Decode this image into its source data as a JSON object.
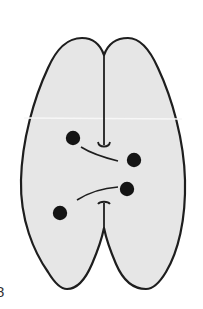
{
  "figure": {
    "panel_label": "8",
    "colors": {
      "fill": "#e6e6e6",
      "stroke": "#1e1e1e",
      "dot": "#141414",
      "background": "#ffffff",
      "scan_line": "#f7f7f7"
    },
    "outline": {
      "top_notch": [
        104,
        55
      ],
      "bottom_notch": [
        104,
        228
      ],
      "left_extent_x": 21,
      "right_extent_x": 185,
      "top_y": 38,
      "bottom_y": 289
    },
    "dots": [
      {
        "id": "dot-1",
        "cx": 73,
        "cy": 138,
        "r": 7
      },
      {
        "id": "dot-2",
        "cx": 134,
        "cy": 160,
        "r": 7
      },
      {
        "id": "dot-3",
        "cx": 127,
        "cy": 189,
        "r": 7
      },
      {
        "id": "dot-4",
        "cx": 60,
        "cy": 213,
        "r": 7
      }
    ],
    "arcs": [
      {
        "id": "arc-upper",
        "from": [
          81,
          147
        ],
        "to": [
          118,
          161
        ]
      },
      {
        "id": "arc-lower",
        "from": [
          77,
          200
        ],
        "to": [
          118,
          187
        ]
      }
    ],
    "stems": [
      {
        "id": "stem-top",
        "from": [
          104,
          55
        ],
        "to": [
          104,
          145
        ],
        "end": "cup"
      },
      {
        "id": "stem-bottom",
        "from": [
          104,
          203
        ],
        "to": [
          104,
          228
        ],
        "end": "t-bar"
      }
    ]
  }
}
